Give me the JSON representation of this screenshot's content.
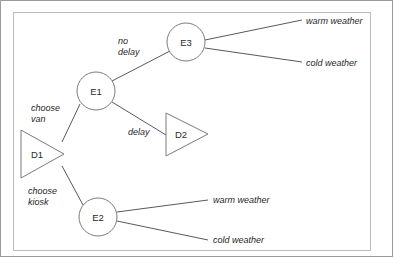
{
  "figure": {
    "type": "decision-tree",
    "background_color": "#ffffff",
    "frame_color": "#9b9b9b",
    "inner_frame_color": "#b9bcc0",
    "line_color": "#595959",
    "node_stroke_color": "#7b7b7b",
    "node_fill_color": "#ffffff",
    "text_color": "#1f1f1f"
  },
  "nodes": [
    {
      "id": "D1",
      "label": "D1",
      "shape": "triangle-right",
      "kind": "decision",
      "x": 21,
      "y": 130,
      "width": 43,
      "height": 48,
      "label_x": 37,
      "label_y": 154
    },
    {
      "id": "D2",
      "label": "D2",
      "shape": "triangle-right",
      "kind": "decision",
      "x": 166,
      "y": 113,
      "width": 42,
      "height": 43,
      "label_x": 181,
      "label_y": 134
    },
    {
      "id": "E1",
      "label": "E1",
      "shape": "circle",
      "kind": "event",
      "cx": 96,
      "cy": 91,
      "r": 19
    },
    {
      "id": "E2",
      "label": "E2",
      "shape": "circle",
      "kind": "event",
      "cx": 98,
      "cy": 217,
      "r": 19
    },
    {
      "id": "E3",
      "label": "E3",
      "shape": "circle",
      "kind": "event",
      "cx": 186,
      "cy": 42,
      "r": 19
    }
  ],
  "edges": [
    {
      "id": "d1-e1",
      "from": "D1",
      "to": "E1",
      "label": "choose\nvan",
      "label_lines": [
        "choose",
        "van"
      ],
      "x1": 62,
      "y1": 142,
      "x2": 80,
      "y2": 104,
      "label_x": 31,
      "label_y": 111
    },
    {
      "id": "d1-e2",
      "from": "D1",
      "to": "E2",
      "label": "choose\nkiosk",
      "label_lines": [
        "choose",
        "kiosk"
      ],
      "x1": 62,
      "y1": 166,
      "x2": 83,
      "y2": 205,
      "label_x": 28,
      "label_y": 194
    },
    {
      "id": "e1-e3",
      "from": "E1",
      "to": "E3",
      "label": "no\ndelay",
      "label_lines": [
        "no",
        "delay"
      ],
      "x1": 112,
      "y1": 81,
      "x2": 170,
      "y2": 51,
      "label_x": 118,
      "label_y": 44
    },
    {
      "id": "e1-d2",
      "from": "E1",
      "to": "D2",
      "label": "delay",
      "label_lines": [
        "delay"
      ],
      "x1": 112,
      "y1": 102,
      "x2": 166,
      "y2": 135,
      "label_x": 128,
      "label_y": 135
    },
    {
      "id": "e3-warm",
      "from": "E3",
      "to": "warm-weather-top",
      "label": "",
      "label_lines": [],
      "x1": 205,
      "y1": 40,
      "x2": 302,
      "y2": 20,
      "label_x": 0,
      "label_y": 0
    },
    {
      "id": "e3-cold",
      "from": "E3",
      "to": "cold-weather-top",
      "label": "",
      "label_lines": [],
      "x1": 205,
      "y1": 48,
      "x2": 302,
      "y2": 62,
      "label_x": 0,
      "label_y": 0
    },
    {
      "id": "e2-warm",
      "from": "E2",
      "to": "warm-weather-bottom",
      "label": "",
      "label_lines": [],
      "x1": 117,
      "y1": 212,
      "x2": 208,
      "y2": 200,
      "label_x": 0,
      "label_y": 0
    },
    {
      "id": "e2-cold",
      "from": "E2",
      "to": "cold-weather-bottom",
      "label": "",
      "label_lines": [],
      "x1": 117,
      "y1": 221,
      "x2": 208,
      "y2": 240,
      "label_x": 0,
      "label_y": 0
    }
  ],
  "outcomes": [
    {
      "id": "warm-weather-top",
      "label": "warm weather",
      "x": 306,
      "y": 24,
      "parent": "E3"
    },
    {
      "id": "cold-weather-top",
      "label": "cold weather",
      "x": 306,
      "y": 66,
      "parent": "E3"
    },
    {
      "id": "warm-weather-bottom",
      "label": "warm weather",
      "x": 213,
      "y": 203,
      "parent": "E2"
    },
    {
      "id": "cold-weather-bottom",
      "label": "cold weather",
      "x": 213,
      "y": 243,
      "parent": "E2"
    }
  ]
}
